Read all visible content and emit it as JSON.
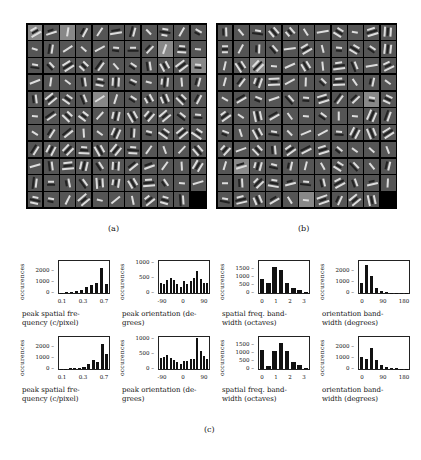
{
  "figure": {
    "panels": {
      "a": {
        "label": "(a)",
        "rows": 11,
        "cols": 11
      },
      "b": {
        "label": "(b)",
        "rows": 11,
        "cols": 11
      },
      "c": {
        "label": "(c)"
      }
    }
  },
  "chart_data": [
    {
      "type": "bar",
      "position": "row1-col1",
      "title": "",
      "xlabel": "peak spatial frequency (c/pixel)",
      "xlabel_lines": [
        "peak spatial fre-",
        "quency (c/pixel)"
      ],
      "ylabel": "occurences",
      "xticks": [
        "0.1",
        "0.3",
        "0.7"
      ],
      "yticks": [
        "0",
        "1000",
        "2000"
      ],
      "ylim": [
        0,
        3000
      ],
      "values": [
        30,
        60,
        100,
        180,
        320,
        550,
        780,
        900,
        2300,
        800
      ]
    },
    {
      "type": "bar",
      "position": "row1-col2",
      "title": "",
      "xlabel": "peak orientation (degrees)",
      "xlabel_lines": [
        "peak orientation (de-",
        "grees)"
      ],
      "ylabel": "occurences",
      "xticks": [
        "-90",
        "0",
        "90"
      ],
      "yticks": [
        "0",
        "500",
        "1000"
      ],
      "ylim": [
        0,
        1100
      ],
      "values": [
        350,
        320,
        460,
        510,
        460,
        300,
        220,
        400,
        320,
        400,
        530,
        760,
        480,
        360,
        360
      ]
    },
    {
      "type": "bar",
      "position": "row1-col3",
      "title": "",
      "xlabel": "spatial freq. bandwidth (octaves)",
      "xlabel_lines": [
        "spatial freq. band-",
        "width (octaves)"
      ],
      "ylabel": "occurences",
      "xticks": [
        "0",
        "1",
        "2",
        "3"
      ],
      "yticks": [
        "0",
        "500",
        "1000",
        "1500"
      ],
      "ylim": [
        0,
        2000
      ],
      "values": [
        900,
        650,
        1600,
        1450,
        600,
        300,
        200,
        80
      ]
    },
    {
      "type": "bar",
      "position": "row1-col4",
      "title": "",
      "xlabel": "orientation bandwidth (degrees)",
      "xlabel_lines": [
        "orientation band-",
        "width (degrees)"
      ],
      "ylabel": "occurences",
      "xticks": [
        "0",
        "90",
        "180"
      ],
      "yticks": [
        "0",
        "1000",
        "2000"
      ],
      "ylim": [
        0,
        3000
      ],
      "values": [
        900,
        2600,
        1600,
        500,
        200,
        80,
        40,
        20,
        10,
        5
      ]
    },
    {
      "type": "bar",
      "position": "row2-col1",
      "title": "",
      "xlabel": "peak spatial frequency (c/pixel)",
      "xlabel_lines": [
        "peak spatial fre-",
        "quency (c/pixel)"
      ],
      "ylabel": "occurences",
      "xticks": [
        "0.1",
        "0.3",
        "0.7"
      ],
      "yticks": [
        "0",
        "1000",
        "2000"
      ],
      "ylim": [
        0,
        3000
      ],
      "values": [
        10,
        20,
        50,
        60,
        100,
        200,
        500,
        800,
        650,
        2300,
        1450
      ]
    },
    {
      "type": "bar",
      "position": "row2-col2",
      "title": "",
      "xlabel": "peak orientation (degrees)",
      "xlabel_lines": [
        "peak orientation (de-",
        "grees)"
      ],
      "ylabel": "occurences",
      "xticks": [
        "-90",
        "0",
        "90"
      ],
      "yticks": [
        "0",
        "500",
        "1000"
      ],
      "ylim": [
        0,
        1100
      ],
      "values": [
        380,
        420,
        470,
        380,
        320,
        250,
        180,
        280,
        260,
        330,
        360,
        1050,
        620,
        450,
        360
      ]
    },
    {
      "type": "bar",
      "position": "row2-col3",
      "title": "",
      "xlabel": "spatial freq. bandwidth (octaves)",
      "xlabel_lines": [
        "spatial freq. band-",
        "width (octaves)"
      ],
      "ylabel": "occurences",
      "xticks": [
        "0",
        "1",
        "2",
        "3"
      ],
      "yticks": [
        "0",
        "500",
        "1000",
        "1500"
      ],
      "ylim": [
        0,
        2000
      ],
      "values": [
        1200,
        200,
        1150,
        1600,
        1150,
        450,
        220,
        60
      ]
    },
    {
      "type": "bar",
      "position": "row2-col4",
      "title": "",
      "xlabel": "orientation bandwidth (degrees)",
      "xlabel_lines": [
        "orientation band-",
        "width (degrees)"
      ],
      "ylabel": "occurences",
      "xticks": [
        "0",
        "90",
        "180"
      ],
      "yticks": [
        "0",
        "1000",
        "2000"
      ],
      "ylim": [
        0,
        3000
      ],
      "values": [
        1100,
        950,
        2000,
        850,
        400,
        200,
        100,
        80,
        40,
        20
      ]
    }
  ]
}
